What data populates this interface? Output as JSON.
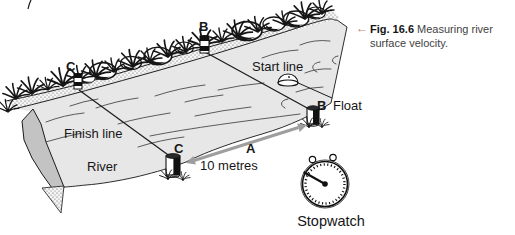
{
  "caption": {
    "arrow": "←",
    "figure_label": "Fig. 16.6",
    "text": "Measuring river surface velocity."
  },
  "diagram": {
    "labels": {
      "start_line": "Start line",
      "finish_line": "Finish line",
      "river": "River",
      "float": "Float",
      "marker_b_far": "B",
      "marker_b_near": "B",
      "marker_c_far": "C",
      "marker_c_near": "C",
      "segment": "A",
      "distance": "10 metres",
      "stopwatch": "Stopwatch"
    },
    "colors": {
      "water_surface": "#e7e7e7",
      "bank_cut_face": "#c3c3c3",
      "distance_arrow": "#9e9e9e",
      "caption_arrow": "#c4836b",
      "ink": "#161616"
    }
  }
}
